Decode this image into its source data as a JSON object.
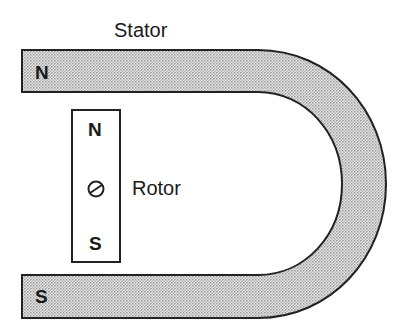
{
  "diagram": {
    "stator": {
      "label": "Stator",
      "north_pole": "N",
      "south_pole": "S",
      "fill_color": "#d9d9d9",
      "outline_color": "#222222"
    },
    "rotor": {
      "label": "Rotor",
      "north_pole": "N",
      "south_pole": "S",
      "pivot_icon": "pivot-circle-with-slash"
    }
  }
}
